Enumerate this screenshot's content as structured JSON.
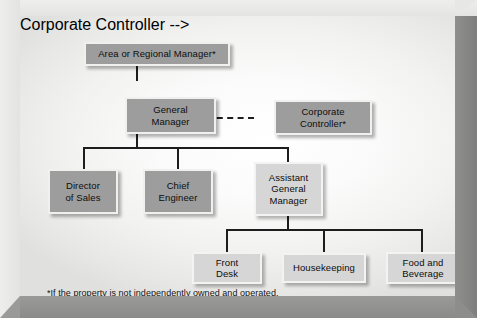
{
  "diagram": {
    "type": "organization-chart",
    "footnote": "*If the property is not independently owned and operated.",
    "colors": {
      "node_dark_fill": "#9d9d9d",
      "node_light_fill": "#d6d6d6",
      "node_border": "#f0f0ef",
      "connector": "#1d1d1d",
      "frame_light": "#e9e9e7",
      "frame_dark": "#8d8d8b",
      "canvas": "#fbfbfb",
      "text": "#0d0d0d"
    },
    "nodes": [
      {
        "id": "area-or-regional-manager",
        "label": "Area or Regional Manager*",
        "tier": 1,
        "style": "dark",
        "x": 64,
        "y": 26,
        "w": 146,
        "h": 24
      },
      {
        "id": "general-manager",
        "label": "General\nManager",
        "tier": 2,
        "style": "dark",
        "x": 105,
        "y": 81,
        "w": 91,
        "h": 37
      },
      {
        "id": "corporate-controller",
        "label": "Corporate\nController*",
        "tier": 2,
        "style": "dark",
        "x": 254,
        "y": 84,
        "w": 98,
        "h": 35
      },
      {
        "id": "director-of-sales",
        "label": "Director\nof Sales",
        "tier": 3,
        "style": "dark",
        "x": 48,
        "y": 153,
        "w": 70,
        "h": 45
      },
      {
        "id": "chief-engineer",
        "label": "Chief\nEngineer",
        "tier": 3,
        "style": "dark",
        "x": 143,
        "y": 153,
        "w": 70,
        "h": 45
      },
      {
        "id": "assistant-general-manager",
        "label": "Assistant\nGeneral\nManager",
        "tier": 3,
        "style": "light",
        "x": 234,
        "y": 146,
        "w": 69,
        "h": 54
      },
      {
        "id": "front-desk",
        "label": "Front\nDesk",
        "tier": 4,
        "style": "light",
        "x": 172,
        "y": 236,
        "w": 70,
        "h": 32
      },
      {
        "id": "housekeeping",
        "label": "Housekeeping",
        "tier": 4,
        "style": "light",
        "x": 262,
        "y": 236,
        "w": 84,
        "h": 30
      },
      {
        "id": "food-and-beverage",
        "label": "Food and\nBeverage",
        "tier": 4,
        "style": "light",
        "x": 366,
        "y": 236,
        "w": 74,
        "h": 32
      }
    ],
    "connections": [
      {
        "from": "area-or-regional-manager",
        "to": "general-manager",
        "style": "solid"
      },
      {
        "from": "general-manager",
        "to": "corporate-controller",
        "style": "dashed"
      },
      {
        "from": "general-manager",
        "to": "director-of-sales",
        "style": "solid"
      },
      {
        "from": "general-manager",
        "to": "chief-engineer",
        "style": "solid"
      },
      {
        "from": "general-manager",
        "to": "assistant-general-manager",
        "style": "solid"
      },
      {
        "from": "assistant-general-manager",
        "to": "front-desk",
        "style": "solid"
      },
      {
        "from": "assistant-general-manager",
        "to": "housekeeping",
        "style": "solid"
      },
      {
        "from": "assistant-general-manager",
        "to": "food-and-beverage",
        "style": "solid"
      }
    ]
  }
}
